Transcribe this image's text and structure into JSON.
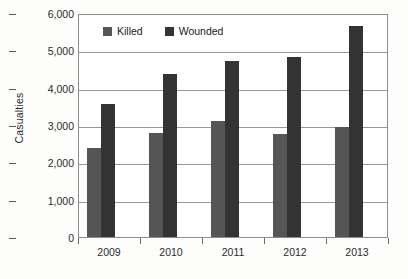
{
  "chart_data": {
    "type": "bar",
    "title": "",
    "xlabel": "",
    "ylabel": "Casualties",
    "categories": [
      "2009",
      "2010",
      "2011",
      "2012",
      "2013"
    ],
    "series": [
      {
        "name": "Killed",
        "color": "#555555",
        "values": [
          2380,
          2780,
          3110,
          2760,
          2950
        ]
      },
      {
        "name": "Wounded",
        "color": "#333333",
        "values": [
          3560,
          4370,
          4710,
          4820,
          5640
        ]
      }
    ],
    "ylim": [
      0,
      6000
    ],
    "y_ticks": [
      0,
      1000,
      2000,
      3000,
      4000,
      5000,
      6000
    ],
    "y_tick_labels": [
      "0",
      "1,000",
      "2,000",
      "3,000",
      "4,000",
      "5,000",
      "6,000"
    ],
    "grid": "horizontal",
    "legend_position": "top-left-inside"
  }
}
